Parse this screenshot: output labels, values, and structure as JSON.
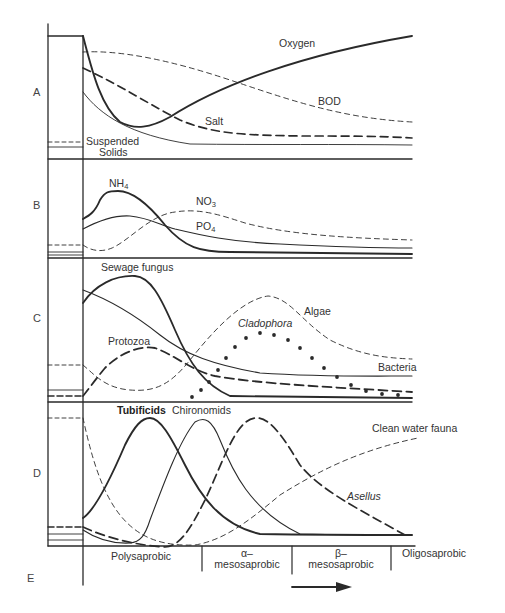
{
  "panels": {
    "A": "A",
    "B": "B",
    "C": "C",
    "D": "D",
    "E": "E"
  },
  "panel_a": {
    "oxygen": "Oxygen",
    "bod": "BOD",
    "salt": "Salt",
    "suspended_solids_1": "Suspended",
    "suspended_solids_2": "Solids"
  },
  "panel_b": {
    "nh4": "NH",
    "nh4_sub": "4",
    "no3": "NO",
    "no3_sub": "3",
    "po4": "PO",
    "po4_sub": "4"
  },
  "panel_c": {
    "sewage_fungus": "Sewage fungus",
    "algae": "Algae",
    "cladophora": "Cladophora",
    "protozoa": "Protozoa",
    "bacteria": "Bacteria"
  },
  "panel_d": {
    "tubificids": "Tubificids",
    "chironomids": "Chironomids",
    "clean_water_fauna": "Clean water fauna",
    "asellus": "Asellus"
  },
  "zones": [
    {
      "line1": "Polysaprobic",
      "line2": ""
    },
    {
      "line1": "α–",
      "line2": "mesosaprobic"
    },
    {
      "line1": "β–",
      "line2": "mesosaprobic"
    },
    {
      "line1": "Oligosaprobic",
      "line2": ""
    }
  ],
  "flow_direction": "downstream-arrow",
  "colors": {
    "ink": "#2a2a2a",
    "text": "#333333",
    "background": "#ffffff"
  }
}
